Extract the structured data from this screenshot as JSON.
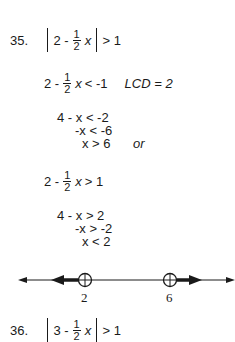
{
  "problems": [
    {
      "number": "35.",
      "statement": {
        "left": "2 -",
        "frac_num": "1",
        "frac_den": "2",
        "var": "x",
        "rhs": "> 1"
      },
      "case1": {
        "line1": {
          "left": "2 -",
          "frac_num": "1",
          "frac_den": "2",
          "var": "x",
          "rhs": "< -1",
          "note": "LCD = 2"
        },
        "line2": "4 - x < -2",
        "line3": "-x < -6",
        "line4": "x > 6",
        "connector": "or"
      },
      "case2": {
        "line1": {
          "left": "2 -",
          "frac_num": "1",
          "frac_den": "2",
          "var": "x",
          "rhs": "> 1"
        },
        "line2": "4 - x > 2",
        "line3": "-x > -2",
        "line4": "x < 2"
      },
      "number_line": {
        "points": [
          {
            "label": "2",
            "type": "open-circle",
            "shade": "left"
          },
          {
            "label": "6",
            "type": "open-circle",
            "shade": "right"
          }
        ]
      }
    },
    {
      "number": "36.",
      "statement": {
        "left": "3 -",
        "frac_num": "1",
        "frac_den": "2",
        "var": "x",
        "rhs": "> 1"
      }
    }
  ]
}
